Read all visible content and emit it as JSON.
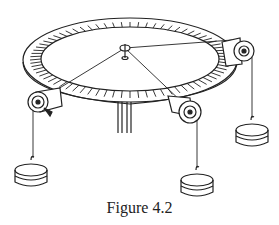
{
  "figure": {
    "caption": "Figure 4.2",
    "parts": {
      "table": "circular force table with degree scale",
      "center_ring": "central ring with pin",
      "pulleys": [
        "left pulley",
        "front-right pulley",
        "right pulley"
      ],
      "weights": [
        "left hanging mass",
        "front hanging mass",
        "right hanging mass"
      ],
      "stand": "support post"
    },
    "colors": {
      "stroke": "#222222",
      "background": "#ffffff"
    }
  }
}
